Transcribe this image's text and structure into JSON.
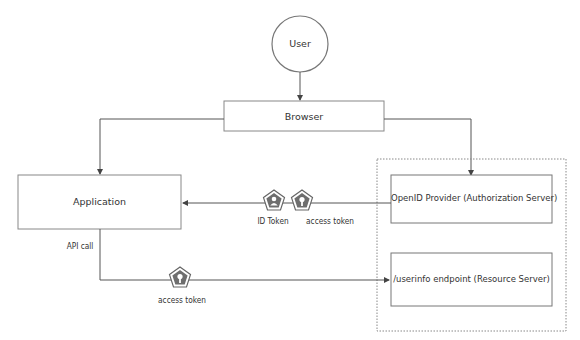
{
  "nodes": {
    "user": {
      "label": "User"
    },
    "browser": {
      "label": "Browser"
    },
    "application": {
      "label": "Application"
    },
    "openid_provider": {
      "label": "OpenID Provider (Authorization Server)"
    },
    "userinfo_endpoint": {
      "label": "/userinfo endpoint (Resource Server)"
    }
  },
  "edges": {
    "id_token": {
      "label": "ID Token",
      "icon": "user-badge-icon"
    },
    "access_token_1": {
      "label": "access token",
      "icon": "key-badge-icon"
    },
    "api_call": {
      "label": "API call"
    },
    "access_token_2": {
      "label": "access token",
      "icon": "key-badge-icon"
    }
  },
  "colors": {
    "stroke": "#555555",
    "badge_fill": "#6e6e6e",
    "dotted_border": "#888888"
  }
}
